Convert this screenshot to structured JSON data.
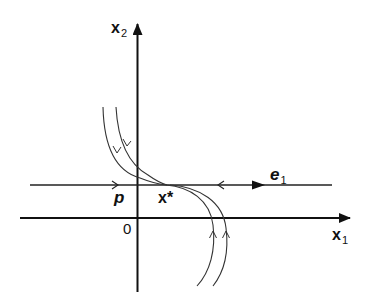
{
  "diagram": {
    "type": "phase-portrait",
    "colors": {
      "axis": "#111111",
      "curve": "#333333",
      "background": "#ffffff"
    },
    "axes": {
      "x_label": "x",
      "x_subscript": "1",
      "y_label": "x",
      "y_subscript": "2",
      "origin_label": "0"
    },
    "labels": {
      "point_p": "p",
      "fixed_point": "x*",
      "eigenvector": "e",
      "eigenvector_subscript": "1"
    },
    "elements": [
      {
        "id": "x1-axis",
        "kind": "axis",
        "direction": "right"
      },
      {
        "id": "x2-axis",
        "kind": "axis",
        "direction": "up"
      },
      {
        "id": "e1-line",
        "kind": "invariant-line",
        "arrows": [
          "right-open-left-of-origin",
          "left-open-right-of-xstar",
          "right-filled-e1"
        ]
      },
      {
        "id": "trajectory-upper-inner",
        "kind": "trajectory",
        "flow": "toward x*"
      },
      {
        "id": "trajectory-upper-outer",
        "kind": "trajectory",
        "flow": "toward x*"
      },
      {
        "id": "trajectory-lower-inner",
        "kind": "trajectory",
        "flow": "toward x*"
      },
      {
        "id": "trajectory-lower-outer",
        "kind": "trajectory",
        "flow": "toward x*"
      }
    ]
  }
}
